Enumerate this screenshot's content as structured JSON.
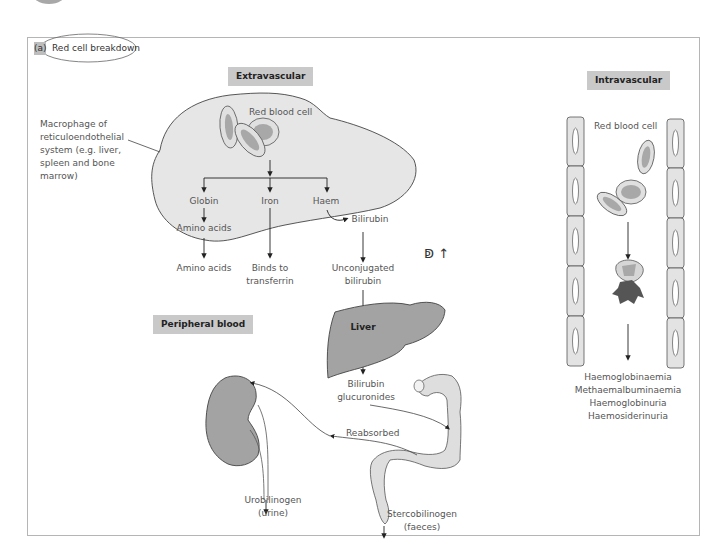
{
  "figure": {
    "panel_letter": "(a)",
    "title": "Red cell breakdown",
    "handwritten_note": "ↁ ↑"
  },
  "extravascular": {
    "heading": "Extravascular",
    "macrophage_label_lines": [
      "Macrophage of",
      "reticuloendothelial",
      "system (e.g. liver,",
      "spleen and bone",
      "marrow)"
    ],
    "red_blood_cell": "Red blood cell",
    "globin": "Globin",
    "iron": "Iron",
    "haem": "Haem",
    "amino_acids_inner": "Amino acids",
    "bilirubin": "Bilirubin",
    "amino_acids_outer": "Amino acids",
    "binds_to_transferrin_lines": [
      "Binds to",
      "transferrin"
    ],
    "unconjugated_bilirubin_lines": [
      "Unconjugated",
      "bilirubin"
    ],
    "liver": "Liver",
    "bilirubin_glucuronides_lines": [
      "Bilirubin",
      "glucuronides"
    ],
    "reabsorbed": "Reabsorbed",
    "urobilinogen_lines": [
      "Urobilinogen",
      "(urine)"
    ],
    "stercobilinogen_lines": [
      "Stercobilinogen",
      "(faeces)"
    ]
  },
  "peripheral": {
    "heading": "Peripheral blood"
  },
  "intravascular": {
    "heading": "Intravascular",
    "red_blood_cell": "Red blood cell",
    "outcomes": [
      "Haemoglobinaemia",
      "Methaemalbuminaemia",
      "Haemoglobinuria",
      "Haemosiderinuria"
    ]
  },
  "colors": {
    "cell_fill": "#e6e6e6",
    "organ_fill": "#a3a3a3",
    "rbc_inner": "#a8a8a8",
    "tag_bg": "#c9c9c9",
    "dark_clot": "#555555"
  }
}
